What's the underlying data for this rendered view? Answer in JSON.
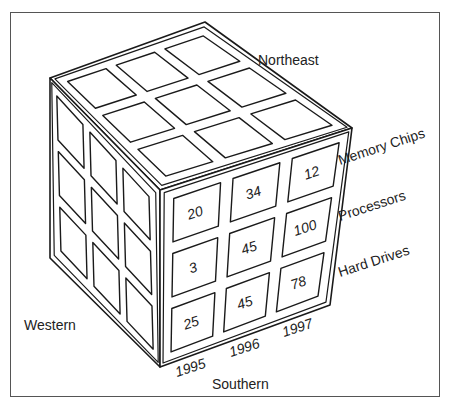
{
  "diagram": {
    "type": "data-cube",
    "dimensions": {
      "region": [
        "Northeast",
        "Western",
        "Southern"
      ],
      "product": [
        "Memory Chips",
        "Processors",
        "Hard Drives"
      ],
      "year": [
        "1995",
        "1996",
        "1997"
      ]
    },
    "labels": {
      "top": "Northeast",
      "left": "Western",
      "bottom": "Southern",
      "rows": [
        "Memory Chips",
        "Processors",
        "Hard Drives"
      ],
      "cols": [
        "1995",
        "1996",
        "1997"
      ]
    },
    "front_face": {
      "region": "Southern",
      "cells": [
        [
          "20",
          "34",
          "12"
        ],
        [
          "3",
          "45",
          "100"
        ],
        [
          "25",
          "45",
          "78"
        ]
      ]
    }
  },
  "colors": {
    "stroke": "#1a1a1a",
    "background": "#ffffff",
    "frame": "#555555"
  }
}
